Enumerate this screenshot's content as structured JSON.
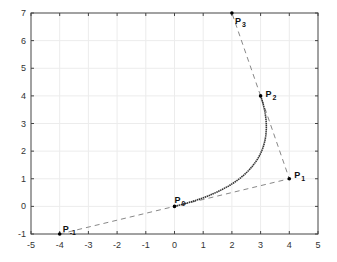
{
  "chart_data": {
    "type": "line",
    "title": "",
    "xlabel": "",
    "ylabel": "",
    "xlim": [
      -5,
      5
    ],
    "ylim": [
      -1,
      7
    ],
    "grid": true,
    "x_ticks": [
      "-5",
      "-4",
      "-3",
      "-2",
      "-1",
      "0",
      "1",
      "2",
      "3",
      "4",
      "5"
    ],
    "y_ticks": [
      "-1",
      "0",
      "1",
      "2",
      "3",
      "4",
      "5",
      "6",
      "7"
    ],
    "points": [
      {
        "label": "P",
        "sub": "0",
        "x": 0,
        "y": 0
      },
      {
        "label": "P",
        "sub": "1",
        "x": 4,
        "y": 1
      },
      {
        "label": "P",
        "sub": "2",
        "x": 3,
        "y": 4
      },
      {
        "label": "P",
        "sub": "3",
        "x": 2,
        "y": 7
      },
      {
        "label": "P",
        "sub": "-1",
        "x": -4,
        "y": -1
      }
    ],
    "series": [
      {
        "name": "control-polygon",
        "style": "dashed",
        "x": [
          -4,
          0,
          4,
          3,
          2
        ],
        "y": [
          -1,
          0,
          1,
          4,
          7
        ]
      },
      {
        "name": "curve",
        "style": "dotted-solid",
        "x": [
          0,
          1,
          2,
          2.7,
          3.1,
          3.0
        ],
        "y": [
          0,
          0.4,
          1.1,
          2.0,
          3.2,
          4.0
        ]
      }
    ]
  }
}
